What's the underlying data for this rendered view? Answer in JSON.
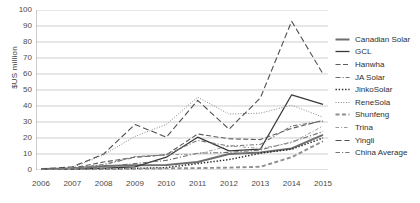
{
  "chart_data": {
    "type": "line",
    "title": "",
    "xlabel": "",
    "ylabel": "$US million",
    "ylim": [
      0,
      100
    ],
    "ytick_step": 10,
    "grid": true,
    "legend_position": "right",
    "categories": [
      "2006",
      "2007",
      "2008",
      "2009",
      "2010",
      "2011",
      "2012",
      "2013",
      "2014",
      "2015"
    ],
    "yticks": [
      "100",
      "90",
      "80",
      "70",
      "60",
      "50",
      "40",
      "30",
      "20",
      "10",
      "0"
    ],
    "series": [
      {
        "name": "Canadian Solar",
        "style": "thick-solid",
        "color": "#6e6e6e",
        "values": [
          0.6,
          1.0,
          2.5,
          3.0,
          3.2,
          5.0,
          10.0,
          11.0,
          13.5,
          22.0
        ]
      },
      {
        "name": "GCL",
        "style": "solid",
        "color": "#3a3a3a",
        "values": [
          0.4,
          0.6,
          1.2,
          2.0,
          8.0,
          20.5,
          12.0,
          13.0,
          47.0,
          41.0
        ]
      },
      {
        "name": "Hanwha",
        "style": "dashed",
        "color": "#5c5c5c",
        "values": [
          0.5,
          1.2,
          5.0,
          8.0,
          9.5,
          22.5,
          19.5,
          19.0,
          26.0,
          31.0
        ]
      },
      {
        "name": "JA Solar",
        "style": "dash-dot",
        "color": "#707070",
        "values": [
          0.3,
          0.8,
          2.0,
          4.0,
          6.0,
          10.5,
          11.0,
          12.5,
          17.5,
          24.0
        ]
      },
      {
        "name": "JinkoSolar",
        "style": "dotted",
        "color": "#2b2b2b",
        "values": [
          0.2,
          0.4,
          0.7,
          1.0,
          1.5,
          4.0,
          6.5,
          10.5,
          13.0,
          20.0
        ]
      },
      {
        "name": "ReneSola",
        "style": "fine-dotted",
        "color": "#8a8a8a",
        "values": [
          0.5,
          1.5,
          9.5,
          21.0,
          28.5,
          45.5,
          35.0,
          35.5,
          40.5,
          33.0
        ]
      },
      {
        "name": "Shunfeng",
        "style": "thick-dash",
        "color": "#8f8f8f",
        "values": [
          0.2,
          0.3,
          0.5,
          0.8,
          1.0,
          1.2,
          1.5,
          2.0,
          8.0,
          18.0
        ]
      },
      {
        "name": "Trina",
        "style": "dash-dot-light",
        "color": "#9a9a9a",
        "values": [
          0.4,
          0.9,
          3.0,
          8.5,
          9.5,
          10.0,
          15.0,
          13.5,
          17.0,
          27.5
        ]
      },
      {
        "name": "Yingli",
        "style": "long-dash",
        "color": "#4f4f4f",
        "values": [
          0.6,
          2.0,
          10.0,
          28.5,
          20.5,
          43.5,
          25.5,
          45.0,
          93.0,
          60.0
        ]
      },
      {
        "name": "China Average",
        "style": "dash-dot-dense",
        "color": "#777777",
        "values": [
          0.4,
          1.0,
          3.5,
          8.0,
          9.5,
          18.5,
          15.0,
          16.0,
          27.5,
          30.5
        ]
      }
    ]
  }
}
